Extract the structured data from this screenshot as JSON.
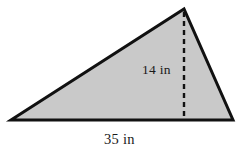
{
  "figure": {
    "shape_name": "triangle",
    "fill_color": "#c9c9c9",
    "outline_color": "#111111",
    "background_color": "#ffffff",
    "dashed_line_color": "#111111",
    "labels": {
      "height": "14 in",
      "base": "35 in"
    },
    "geometry": {
      "left_vertex": [
        11,
        120
      ],
      "apex_vertex": [
        184,
        9
      ],
      "right_vertex": [
        233,
        120
      ],
      "height_foot": [
        184,
        120
      ],
      "outline_width": 3,
      "dash_width": 2.4,
      "dash_pattern": "5,4"
    }
  }
}
